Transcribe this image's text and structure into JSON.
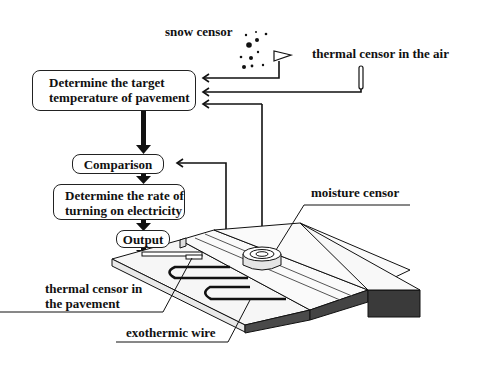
{
  "diagram": {
    "type": "road heating control flow + pavement cross-section",
    "flow_boxes": [
      {
        "id": "target",
        "label_line1": "Determine the target",
        "label_line2": "temperature of pavement"
      },
      {
        "id": "comparison",
        "label": "Comparison"
      },
      {
        "id": "rate",
        "label_line1": "Determine the rate of",
        "label_line2": "turning on electricity"
      },
      {
        "id": "output",
        "label": "Output"
      }
    ],
    "sensors": {
      "snow": "snow censor",
      "air": "thermal censor in the air",
      "moisture": "moisture censor",
      "pavement_line1": "thermal censor in",
      "pavement_line2": "the pavement"
    },
    "components": {
      "wire": "exothermic wire"
    },
    "edges": [
      {
        "from": "snow censor",
        "to": "Determine the target temperature of pavement"
      },
      {
        "from": "thermal censor in the air",
        "to": "Determine the target temperature of pavement"
      },
      {
        "from": "moisture censor",
        "to": "Determine the target temperature of pavement"
      },
      {
        "from": "Determine the target temperature of pavement",
        "to": "Comparison"
      },
      {
        "from": "thermal censor in the pavement",
        "to": "Comparison"
      },
      {
        "from": "Comparison",
        "to": "Determine the rate of turning on electricity"
      },
      {
        "from": "Determine the rate of turning on electricity",
        "to": "Output"
      },
      {
        "from": "Output",
        "to": "exothermic wire"
      }
    ],
    "colors": {
      "line": "#111111",
      "asphalt": "#3a3a3a",
      "slab": "#f4f4f4"
    }
  }
}
